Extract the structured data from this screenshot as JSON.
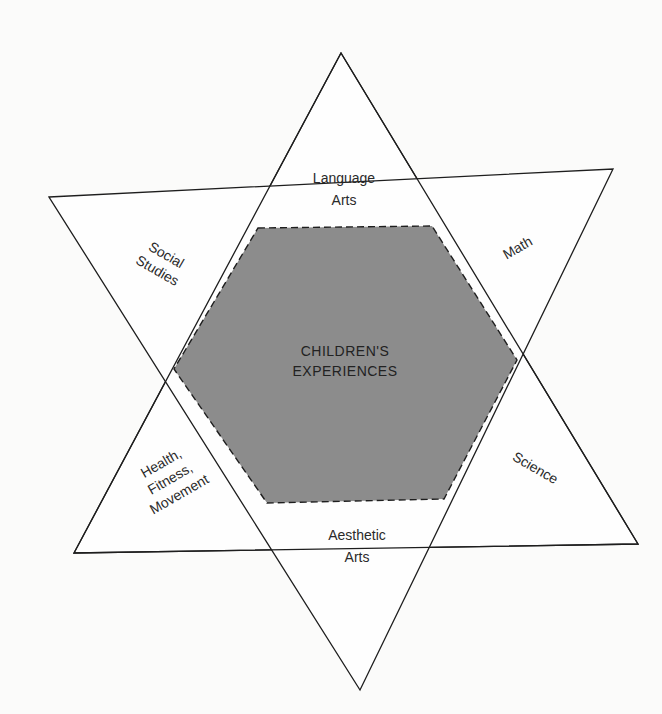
{
  "diagram": {
    "center": {
      "line1": "CHILDREN'S",
      "line2": "EXPERIENCES"
    },
    "points": [
      {
        "id": "language-arts",
        "line1": "Language",
        "line2": "Arts"
      },
      {
        "id": "math",
        "line1": "Math"
      },
      {
        "id": "science",
        "line1": "Science"
      },
      {
        "id": "aesthetic-arts",
        "line1": "Aesthetic",
        "line2": "Arts"
      },
      {
        "id": "health-fitness-movement",
        "line1": "Health,",
        "line2": "Fitness,",
        "line3": "Movement"
      },
      {
        "id": "social-studies",
        "line1": "Social",
        "line2": "Studies"
      }
    ],
    "colors": {
      "hexagon_fill": "#8c8c8c",
      "line": "#1e1e1e",
      "background": "#fbfbfa"
    }
  }
}
